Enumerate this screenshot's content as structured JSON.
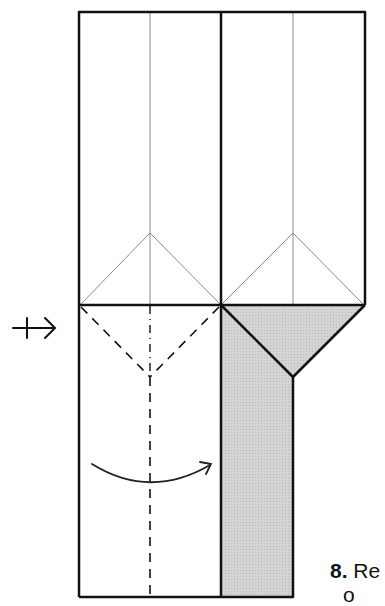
{
  "diagram": {
    "type": "origami-step",
    "step_number": "8.",
    "caption_line1": "Re",
    "caption_line2": "o",
    "colors": {
      "line": "#111111",
      "crease": "#888888",
      "shade": "#cfcfcf",
      "background": "#ffffff"
    },
    "symbols": {
      "turn_over_arrow": "push-arrow-icon",
      "fold_arrow": "curved-fold-arrow-icon"
    }
  }
}
